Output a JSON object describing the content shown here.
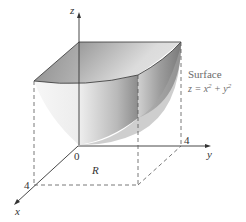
{
  "diagram": {
    "axes": {
      "x_label": "x",
      "y_label": "y",
      "z_label": "z",
      "origin_label": "0",
      "x_tick": "4",
      "y_tick": "4"
    },
    "region_label": "R",
    "surface": {
      "title": "Surface",
      "equation_prefix": "z = x",
      "exp1": "2",
      "plus": " + y",
      "exp2": "2"
    },
    "colors": {
      "axis": "#333333",
      "dashed": "#555555",
      "surface_light": "#f4f4f4",
      "surface_dark": "#8a8a8a",
      "label_text": "#6b6b6b"
    }
  }
}
